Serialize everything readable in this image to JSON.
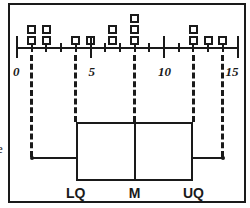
{
  "figure": {
    "edge_glyph": "e",
    "ink_color": "#1a1a1a",
    "background_color": "#ffffff"
  },
  "axis": {
    "min": 0,
    "max": 15,
    "tick_interval": 1,
    "labeled_ticks": [
      {
        "value": 0,
        "label": "0"
      },
      {
        "value": 5,
        "label": "5"
      },
      {
        "value": 10,
        "label": "10"
      },
      {
        "value": 15,
        "label": "15"
      }
    ],
    "tick_values": [
      0,
      1,
      2,
      3,
      4,
      5,
      6,
      7,
      8,
      9,
      10,
      11,
      12,
      13,
      14,
      15
    ]
  },
  "chart_data": {
    "type": "bar",
    "xlabel": "",
    "ylabel": "",
    "xlim": [
      0,
      15
    ],
    "grid": false,
    "legend": "none",
    "plots": [
      {
        "name": "dot-plot",
        "type": "dotplot",
        "marker": "open-square",
        "categories": [
          1,
          2,
          4,
          5,
          6.5,
          8,
          12,
          13,
          14
        ],
        "values": [
          2,
          2,
          1,
          1,
          2,
          3,
          2,
          1,
          1
        ],
        "columns": [
          {
            "x": 1,
            "count": 2
          },
          {
            "x": 2,
            "count": 2
          },
          {
            "x": 4,
            "count": 1
          },
          {
            "x": 5,
            "count": 1
          },
          {
            "x": 6.5,
            "count": 2
          },
          {
            "x": 8,
            "count": 3
          },
          {
            "x": 12,
            "count": 2
          },
          {
            "x": 13,
            "count": 1
          },
          {
            "x": 14,
            "count": 1
          }
        ]
      },
      {
        "name": "box-plot",
        "type": "boxplot",
        "minimum": 1,
        "lower_quartile": 4,
        "median": 8,
        "upper_quartile": 12,
        "maximum": 14,
        "labels": {
          "lower_quartile": "LQ",
          "median": "M",
          "upper_quartile": "UQ"
        }
      }
    ],
    "connectors": [
      {
        "name": "minimum",
        "x": 1
      },
      {
        "name": "lower-quartile",
        "x": 4
      },
      {
        "name": "median",
        "x": 8
      },
      {
        "name": "upper-quartile",
        "x": 12
      },
      {
        "name": "maximum",
        "x": 14
      }
    ]
  }
}
